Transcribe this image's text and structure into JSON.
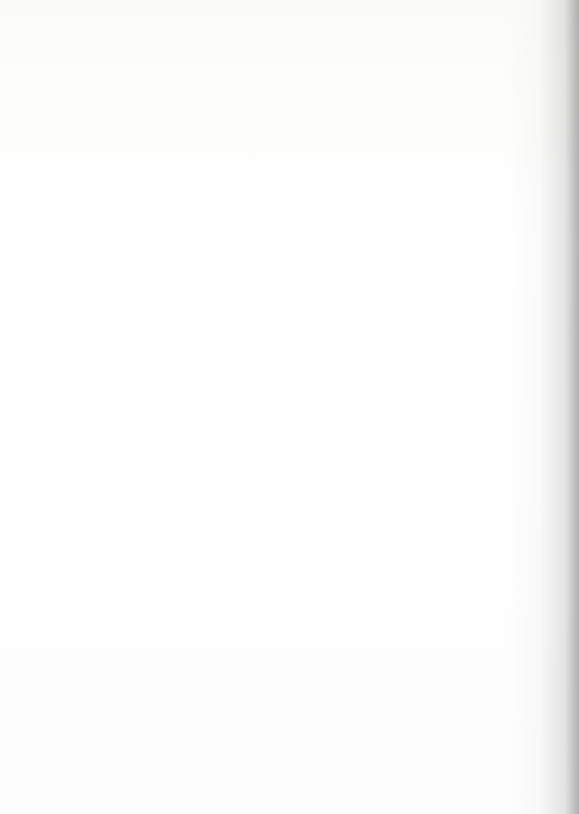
{
  "document": {
    "type": "scanned-page",
    "page_background": "#ffffff",
    "figure_kind": "choropleth county map",
    "frame": {
      "x": 16,
      "y": 24,
      "width": 555,
      "height": 770,
      "border_color": "#2a2a2a"
    },
    "cropped_right_edge": true,
    "gutter_shadow_side": "right"
  },
  "map": {
    "name": "united-states-county-choropleth",
    "region_shown": "Western and Central United States",
    "projection_look": "conic (curved northern border)",
    "has_labels": true,
    "label_legibility": "illegible at scan resolution",
    "states_visible": [
      "Washington",
      "Oregon",
      "California",
      "Nevada",
      "Idaho",
      "Montana",
      "Wyoming",
      "Utah",
      "Arizona",
      "Colorado",
      "New Mexico",
      "North Dakota",
      "South Dakota",
      "Nebraska",
      "Kansas",
      "Oklahoma",
      "Texas",
      "Minnesota",
      "Iowa",
      "Missouri",
      "Arkansas",
      "Louisiana"
    ],
    "insets": [
      {
        "name": "hawaii-inset",
        "label": "Hawaii",
        "x": 25,
        "y": 565,
        "width": 147,
        "height": 101,
        "shape": "rectangle"
      },
      {
        "name": "alaska-inset",
        "label": "Alaska",
        "x": 25,
        "y": 667,
        "width": 430,
        "height": 119,
        "shape": "rectangle-with-angled-right-edge"
      }
    ]
  },
  "legend": {
    "present_in_crop": false,
    "classes": [
      {
        "id": "c0",
        "name": "class-lowest",
        "fill": "#ffffff",
        "pattern": "none",
        "hex": "#ffffff"
      },
      {
        "id": "c1",
        "name": "class-low",
        "fill": "#8e8e8e",
        "pattern": "sparse-diagonal",
        "hex": "#8e8e8e"
      },
      {
        "id": "c2",
        "name": "class-mid-low",
        "fill": "#7a7a7a",
        "pattern": "medium-diagonal",
        "hex": "#7a7a7a"
      },
      {
        "id": "c3",
        "name": "class-mid",
        "fill": "#616161",
        "pattern": "dense-diagonal",
        "hex": "#616161"
      },
      {
        "id": "c4",
        "name": "class-high",
        "fill": "#9a9a9a",
        "pattern": "solid-grey",
        "hex": "#9a9a9a"
      },
      {
        "id": "c5",
        "name": "class-highest",
        "fill": "#2a2a2a",
        "pattern": "near-solid-dark",
        "hex": "#2a2a2a"
      }
    ]
  },
  "notable_features": {
    "dark_cluster": "Texas Panhandle / western Oklahoma / eastern New Mexico",
    "white_cluster": "Washington, Oregon, western Idaho, Nebraska, Kansas",
    "solid_grey_cluster": "California coast, Arizona, Nevada, Alaska interior, Hawaii"
  }
}
